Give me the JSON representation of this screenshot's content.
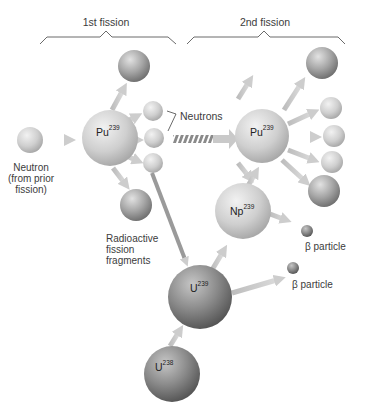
{
  "headers": {
    "first": "1st fission",
    "second": "2nd fission"
  },
  "labels": {
    "neutron_line1": "Neutron",
    "neutron_line2": "(from prior",
    "neutron_line3": "fission)",
    "neutrons": "Neutrons",
    "fragments_line1": "Radioactive",
    "fragments_line2": "fission",
    "fragments_line3": "fragments",
    "beta1": "β particle",
    "beta2": "β particle"
  },
  "nuclei": {
    "pu1": {
      "symbol": "Pu",
      "mass": "239"
    },
    "pu2": {
      "symbol": "Pu",
      "mass": "239"
    },
    "np": {
      "symbol": "Np",
      "mass": "239"
    },
    "u239": {
      "symbol": "U",
      "mass": "239"
    },
    "u238": {
      "symbol": "U",
      "mass": "238"
    }
  },
  "colors": {
    "light_sphere": "#d6d6d6",
    "mid_sphere": "#a9a9a9",
    "dark_sphere": "#7a7a7a",
    "arrow": "#c4c4c4",
    "bracket": "#555555"
  }
}
